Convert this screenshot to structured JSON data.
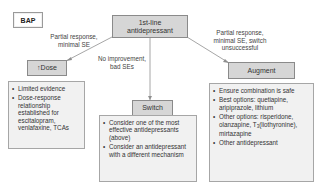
{
  "diagram": {
    "tag": "BAP",
    "root": {
      "label": "1st-line antidepressant"
    },
    "branches": [
      {
        "id": "dose",
        "edge_label": "Partial response, minimal SE",
        "node_label": "↑Dose",
        "bullets": [
          "Limited evidence",
          "Dose-response relationship established for escitalopram, venlafaxine, TCAs"
        ]
      },
      {
        "id": "switch",
        "edge_label": "No improvement, bad SEs",
        "node_label": "Switch",
        "bullets": [
          "Consider one of the most effective antidepressants (above)",
          "Consider an antidepressant with a different mechanism"
        ]
      },
      {
        "id": "augment",
        "edge_label": "Partial response, minimal SE, switch unsuccessful",
        "node_label": "Augment",
        "bullets": [
          "Ensure combination is safe",
          "Best options: quetiapine, aripiprazole, lithium",
          "Other options: risperidone, olanzapine, T3(liothyronine), mirtazapine",
          "Other antidepressant"
        ],
        "bullet3_parts": {
          "pre": "Other options: risperidone, olanzapine, T",
          "sub": "3",
          "post": "(liothyronine), mirtazapine"
        }
      }
    ],
    "colors": {
      "node_fill": "#d6d6d6",
      "list_fill": "#f1f1f1",
      "border": "#8a8a8a",
      "line": "#8f8f8f"
    }
  }
}
